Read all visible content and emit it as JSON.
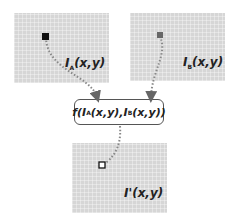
{
  "diagram": {
    "panels": [
      {
        "id": "A",
        "label": "I",
        "subscript": "A",
        "args": "(x,y)"
      },
      {
        "id": "B",
        "label": "I",
        "subscript": "B",
        "args": "(x,y)"
      },
      {
        "id": "out",
        "label": "I'",
        "subscript": "",
        "args": "(x,y)"
      }
    ],
    "function_box": {
      "f": "f(",
      "a_base": "I",
      "a_sub": "A",
      "a_args": "(x,y),",
      "b_base": "I",
      "b_sub": "B",
      "b_args": "(x,y))"
    },
    "colors": {
      "panel_bg": "#d6d6d6",
      "arrow": "#888888",
      "pixel_marker_a": "#111111",
      "pixel_marker_b": "#666666",
      "output_marker": "#ffffff"
    }
  }
}
